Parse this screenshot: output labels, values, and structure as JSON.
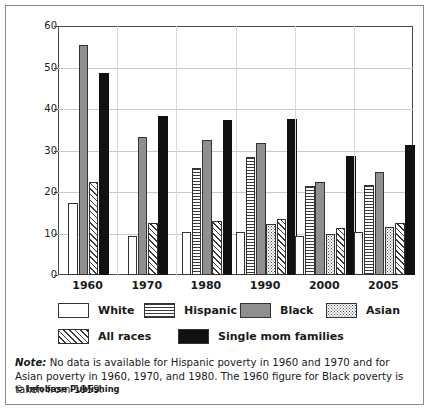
{
  "chart_data": {
    "type": "bar",
    "title": "",
    "xlabel": "",
    "ylabel": "Percent Below Poverty Line",
    "ylim": [
      0,
      60
    ],
    "yticks": [
      0,
      10,
      20,
      30,
      40,
      50,
      60
    ],
    "grid": true,
    "legend_position": "below-axes",
    "categories": [
      "1960",
      "1970",
      "1980",
      "1990",
      "2000",
      "2005"
    ],
    "series": [
      {
        "name": "White",
        "pattern": "white",
        "values": [
          17.4,
          9.5,
          10.3,
          10.4,
          9.5,
          10.3
        ]
      },
      {
        "name": "Hispanic",
        "pattern": "horizontal-lines",
        "values": [
          null,
          null,
          25.7,
          28.5,
          21.4,
          21.6
        ]
      },
      {
        "name": "Black",
        "pattern": "solid-gray",
        "values": [
          55.5,
          33.3,
          32.5,
          31.9,
          22.5,
          24.8
        ]
      },
      {
        "name": "Asian",
        "pattern": "dots",
        "values": [
          null,
          null,
          null,
          12.3,
          9.8,
          11.6
        ]
      },
      {
        "name": "All races",
        "pattern": "diagonal-hatch",
        "values": [
          22.3,
          12.6,
          13.0,
          13.4,
          11.3,
          12.6
        ]
      },
      {
        "name": "Single mom families",
        "pattern": "solid-black",
        "values": [
          48.6,
          38.3,
          37.4,
          37.5,
          28.6,
          31.4
        ]
      }
    ],
    "annotations": [
      "No data is available for Hispanic poverty in 1960 and 1970 and for Asian poverty in 1960, 1970, and 1980.",
      "The 1960 figure for Black poverty is taken from 1959."
    ]
  },
  "legend": {
    "items": [
      {
        "label": "White"
      },
      {
        "label": "Hispanic"
      },
      {
        "label": "Black"
      },
      {
        "label": "Asian"
      },
      {
        "label": "All races"
      },
      {
        "label": "Single mom families"
      }
    ]
  },
  "footnote": {
    "label": "Note:",
    "body": " No data is available for Hispanic poverty in 1960 and 1970 and for Asian poverty in 1960, 1970, and 1980.  The 1960 figure for Black poverty is taken from 1959.",
    "copyright": "© Infobase Publishing"
  },
  "colors": {
    "frame": "#4a4a4a",
    "grid": "#c9c9c9",
    "black_series": "#8f8f8f",
    "single_mom_series": "#111111",
    "text": "#1a1a1a"
  }
}
